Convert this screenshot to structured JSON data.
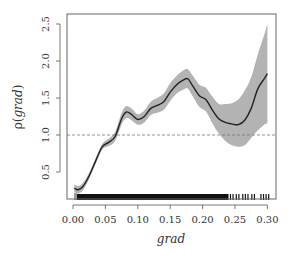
{
  "chart_data": {
    "type": "line",
    "title": "",
    "xlabel": "grad",
    "ylabel_prefix": "ρ(",
    "ylabel_var": "grad",
    "ylabel_suffix": ")",
    "xlim": [
      0.0,
      0.31
    ],
    "ylim": [
      0.14,
      2.64
    ],
    "grid": false,
    "legend": null,
    "x_ticks": [
      0.0,
      0.05,
      0.1,
      0.15,
      0.2,
      0.25,
      0.3
    ],
    "x_tick_labels": [
      "0.00",
      "0.05",
      "0.10",
      "0.15",
      "0.20",
      "0.25",
      "0.30"
    ],
    "y_ticks": [
      0.5,
      1.0,
      1.5,
      2.0,
      2.5
    ],
    "y_tick_labels": [
      "0.5",
      "1.0",
      "1.5",
      "2.0",
      "2.5"
    ],
    "reference_line": {
      "y": 1.0,
      "style": "dashed"
    },
    "series": [
      {
        "name": "estimate",
        "x": [
          0.002,
          0.008,
          0.015,
          0.025,
          0.035,
          0.045,
          0.055,
          0.065,
          0.075,
          0.082,
          0.09,
          0.1,
          0.11,
          0.12,
          0.13,
          0.14,
          0.15,
          0.16,
          0.17,
          0.177,
          0.185,
          0.195,
          0.205,
          0.215,
          0.225,
          0.235,
          0.245,
          0.255,
          0.265,
          0.275,
          0.285,
          0.295,
          0.3
        ],
        "values": [
          0.28,
          0.26,
          0.3,
          0.45,
          0.65,
          0.84,
          0.9,
          0.98,
          1.22,
          1.31,
          1.28,
          1.21,
          1.25,
          1.36,
          1.4,
          1.45,
          1.58,
          1.68,
          1.74,
          1.76,
          1.66,
          1.53,
          1.48,
          1.34,
          1.22,
          1.17,
          1.15,
          1.14,
          1.2,
          1.36,
          1.62,
          1.76,
          1.83
        ]
      },
      {
        "name": "confidence_band_upper",
        "x": [
          0.002,
          0.008,
          0.015,
          0.025,
          0.035,
          0.045,
          0.055,
          0.065,
          0.075,
          0.082,
          0.09,
          0.1,
          0.11,
          0.12,
          0.13,
          0.14,
          0.15,
          0.16,
          0.17,
          0.177,
          0.185,
          0.195,
          0.205,
          0.215,
          0.225,
          0.235,
          0.245,
          0.255,
          0.265,
          0.275,
          0.285,
          0.295,
          0.3
        ],
        "values": [
          0.33,
          0.31,
          0.35,
          0.49,
          0.69,
          0.88,
          0.95,
          1.04,
          1.3,
          1.39,
          1.36,
          1.28,
          1.33,
          1.45,
          1.5,
          1.56,
          1.7,
          1.8,
          1.87,
          1.89,
          1.8,
          1.68,
          1.64,
          1.52,
          1.42,
          1.42,
          1.43,
          1.48,
          1.6,
          1.78,
          2.08,
          2.35,
          2.5
        ]
      },
      {
        "name": "confidence_band_lower",
        "x": [
          0.002,
          0.008,
          0.015,
          0.025,
          0.035,
          0.045,
          0.055,
          0.065,
          0.075,
          0.082,
          0.09,
          0.1,
          0.11,
          0.12,
          0.13,
          0.14,
          0.15,
          0.16,
          0.17,
          0.177,
          0.185,
          0.195,
          0.205,
          0.215,
          0.225,
          0.235,
          0.245,
          0.255,
          0.265,
          0.275,
          0.285,
          0.295,
          0.3
        ],
        "values": [
          0.23,
          0.21,
          0.25,
          0.41,
          0.61,
          0.8,
          0.85,
          0.92,
          1.14,
          1.23,
          1.2,
          1.14,
          1.17,
          1.27,
          1.3,
          1.34,
          1.46,
          1.56,
          1.61,
          1.63,
          1.52,
          1.38,
          1.32,
          1.16,
          1.02,
          0.92,
          0.86,
          0.84,
          0.86,
          0.96,
          1.06,
          1.14,
          1.16
        ]
      }
    ],
    "rug": {
      "dense_range": [
        0.005,
        0.24
      ],
      "sparse_marks": [
        0.243,
        0.247,
        0.252,
        0.256,
        0.262,
        0.266,
        0.27,
        0.276,
        0.28,
        0.29,
        0.294,
        0.298,
        0.302
      ]
    }
  },
  "colors": {
    "line": "#222222",
    "band": "#b3b3b3",
    "axis": "#555555",
    "text": "#333333",
    "reference": "#777777",
    "rug": "#111111"
  }
}
